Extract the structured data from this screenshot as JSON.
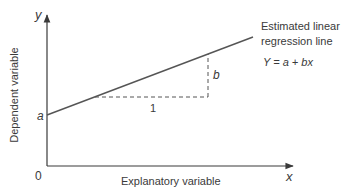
{
  "diagram": {
    "title": "Estimated linear regression line",
    "axes": {
      "x_symbol": "x",
      "y_symbol": "y",
      "origin_label": "0",
      "x_label": "Explanatory variable",
      "y_label": "Dependent variable"
    },
    "line": {
      "label_line1": "Estimated linear",
      "label_line2": "regression line",
      "equation": "Y = a + bx",
      "intercept_label": "a",
      "slope_label": "b",
      "run_label": "1"
    },
    "colors": {
      "axis": "#3a3a3a",
      "line": "#555555",
      "text": "#3a3a3a"
    }
  }
}
